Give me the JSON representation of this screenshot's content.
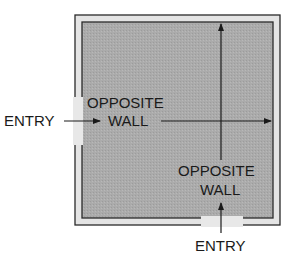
{
  "diagram": {
    "room": {
      "floor_color": "#a9a9a9",
      "wall_fill": "#e6e6e6",
      "wall_line": "#2a2a2a"
    },
    "labels": {
      "left_entry": "ENTRY",
      "left_opposite_line1": "OPPOSITE",
      "left_opposite_line2": "WALL",
      "bottom_opposite_line1": "OPPOSITE",
      "bottom_opposite_line2": "WALL",
      "bottom_entry": "ENTRY"
    }
  }
}
